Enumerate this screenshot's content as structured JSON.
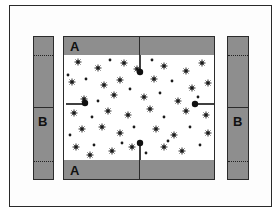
{
  "diagram": {
    "labels": {
      "top_strip": "A",
      "bottom_strip": "A",
      "left_strip": "B",
      "right_strip": "B"
    },
    "colors": {
      "strip_fill": "#8e8e8e",
      "outline": "#2b2b2b",
      "speckle": "#1a1a1a",
      "background": "#ffffff"
    },
    "field": {
      "description": "speckled central area",
      "markers": [
        {
          "position": "left-edge",
          "direction": "pointing-right"
        },
        {
          "position": "right-edge",
          "direction": "pointing-left"
        },
        {
          "position": "top-center",
          "direction": "pointing-down"
        },
        {
          "position": "bottom-center",
          "direction": "pointing-up"
        }
      ]
    }
  }
}
